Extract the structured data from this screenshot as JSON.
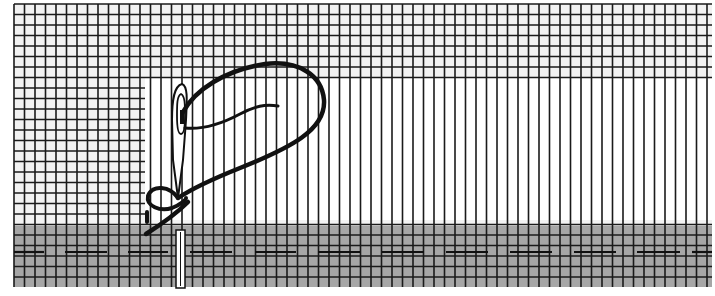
{
  "figure": {
    "colors": {
      "background": "#ffffff",
      "fabric": "#f2f2f2",
      "grid_line": "#1a1a1a",
      "shaded_band": "#a6a6a6",
      "thread": "#111111",
      "needle_fill": "#ffffff",
      "needle_outline": "#111111"
    },
    "grid": {
      "x0": 14,
      "y0": 4,
      "x1": 712,
      "y1": 287,
      "spacing": 10.5,
      "withdrawn_region": {
        "x0": 145,
        "y0": 78,
        "x1": 712,
        "y1": 220
      }
    },
    "shaded_band": {
      "y0": 226,
      "y1": 287
    },
    "running_stitch": {
      "y": 252,
      "dashes": [
        [
          14,
          44
        ],
        [
          65,
          107
        ],
        [
          128,
          168
        ],
        [
          190,
          232
        ],
        [
          255,
          296
        ],
        [
          318,
          360
        ],
        [
          382,
          424
        ],
        [
          446,
          488
        ],
        [
          510,
          552
        ],
        [
          574,
          616
        ],
        [
          637,
          680
        ],
        [
          692,
          712
        ]
      ]
    }
  }
}
